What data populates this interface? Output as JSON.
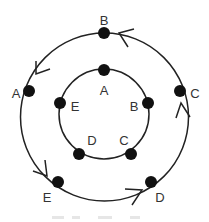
{
  "diagram": {
    "outer_cycle": {
      "nodes": [
        {
          "label": "B",
          "x": 104,
          "y": 33,
          "lx": 104,
          "ly": 22
        },
        {
          "label": "C",
          "x": 180,
          "y": 91,
          "lx": 195,
          "ly": 95
        },
        {
          "label": "D",
          "x": 151,
          "y": 182,
          "lx": 160,
          "ly": 199
        },
        {
          "label": "E",
          "x": 58,
          "y": 182,
          "lx": 47,
          "ly": 199
        },
        {
          "label": "A",
          "x": 29,
          "y": 91,
          "lx": 16,
          "ly": 95
        }
      ],
      "direction": "B → A → E → D → C → B"
    },
    "inner_cycle": {
      "nodes": [
        {
          "label": "A",
          "x": 104,
          "y": 70,
          "lx": 104,
          "ly": 92
        },
        {
          "label": "B",
          "x": 148,
          "y": 103,
          "lx": 134,
          "ly": 108
        },
        {
          "label": "C",
          "x": 131,
          "y": 154,
          "lx": 124,
          "ly": 142
        },
        {
          "label": "D",
          "x": 79,
          "y": 154,
          "lx": 92,
          "ly": 142
        },
        {
          "label": "E",
          "x": 60,
          "y": 103,
          "lx": 75,
          "ly": 108
        }
      ]
    },
    "caption": ""
  }
}
